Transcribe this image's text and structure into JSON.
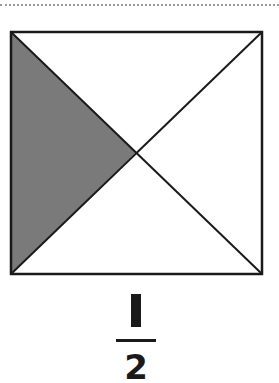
{
  "figure": {
    "shape": "square-divided-by-diagonals",
    "parts_total": 4,
    "parts_shaded": 1,
    "shaded_part": "left-triangle",
    "shade_color": "#7a7a7a",
    "line_color": "#1a1a1a"
  },
  "fraction": {
    "numerator": "1",
    "denominator": "2"
  }
}
